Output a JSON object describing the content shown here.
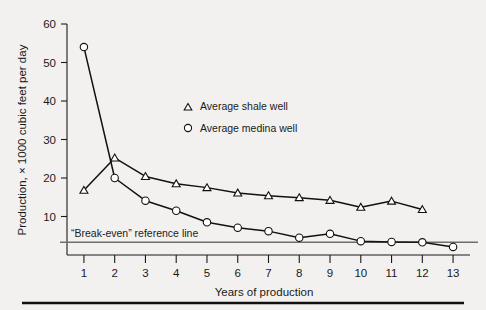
{
  "chart_data": {
    "type": "line",
    "title": "",
    "xlabel": "Years of production",
    "ylabel": "Production, × 1000 cubic feet per day",
    "x": [
      1,
      2,
      3,
      4,
      5,
      6,
      7,
      8,
      9,
      10,
      11,
      12,
      13
    ],
    "xlim": [
      0.45,
      13.55
    ],
    "ylim": [
      0,
      60
    ],
    "xticks": [
      1,
      2,
      3,
      4,
      5,
      6,
      7,
      8,
      9,
      10,
      11,
      12,
      13
    ],
    "xtick_labels": [
      "1",
      "2",
      "3",
      "4",
      "5",
      "6",
      "7",
      "8",
      "9",
      "10",
      "11",
      "12",
      "13"
    ],
    "yticks": [
      10,
      20,
      30,
      40,
      50,
      60
    ],
    "ytick_labels": [
      "10",
      "20",
      "30",
      "40",
      "50",
      "60"
    ],
    "grid": false,
    "legend_position": "center",
    "series": [
      {
        "name": "Average shale well",
        "marker": "triangle",
        "x": [
          1,
          2,
          3,
          4,
          5,
          6,
          7,
          8,
          9,
          10,
          11,
          12
        ],
        "values": [
          16.8,
          25.2,
          20.4,
          18.5,
          17.5,
          16.1,
          15.4,
          14.9,
          14.2,
          12.4,
          14.0,
          11.8
        ]
      },
      {
        "name": "Average medina well",
        "marker": "circle",
        "x": [
          1,
          2,
          3,
          4,
          5,
          6,
          7,
          8,
          9,
          10,
          11,
          12,
          13
        ],
        "values": [
          54.0,
          20.0,
          14.1,
          11.5,
          8.5,
          7.1,
          6.2,
          4.5,
          5.5,
          3.6,
          3.4,
          3.3,
          2.1
        ]
      }
    ],
    "reference_line": {
      "label": "“Break-even” reference line",
      "value": 3.3,
      "color": "#6e6e6e"
    },
    "annotations": []
  },
  "legend": {
    "items": [
      {
        "label": "Average shale well",
        "marker": "triangle"
      },
      {
        "label": "Average medina well",
        "marker": "circle"
      }
    ]
  },
  "colors": {
    "background": "#f2f1ef",
    "ink": "#111111",
    "reference": "#6e6e6e"
  }
}
